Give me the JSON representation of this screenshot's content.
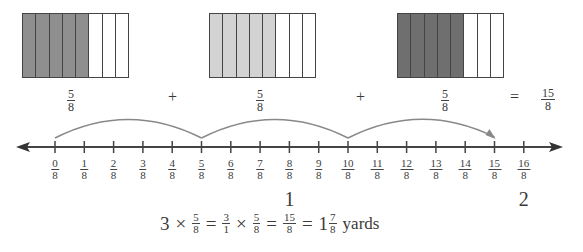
{
  "bars": [
    {
      "label_num": "5",
      "label_den": "8",
      "shaded": 5,
      "total": 8,
      "color": "#8f8f8f"
    },
    {
      "label_num": "5",
      "label_den": "8",
      "shaded": 5,
      "total": 8,
      "color": "#d3d3d3"
    },
    {
      "label_num": "5",
      "label_den": "8",
      "shaded": 5,
      "total": 8,
      "color": "#6f6f6f"
    }
  ],
  "operators": {
    "plus1": "+",
    "plus2": "+",
    "equals": "="
  },
  "sum": {
    "num": "15",
    "den": "8"
  },
  "number_line": {
    "ticks": [
      {
        "num": "0",
        "den": "8"
      },
      {
        "num": "1",
        "den": "8"
      },
      {
        "num": "2",
        "den": "8"
      },
      {
        "num": "3",
        "den": "8"
      },
      {
        "num": "4",
        "den": "8"
      },
      {
        "num": "5",
        "den": "8"
      },
      {
        "num": "6",
        "den": "8"
      },
      {
        "num": "7",
        "den": "8"
      },
      {
        "num": "8",
        "den": "8"
      },
      {
        "num": "9",
        "den": "8"
      },
      {
        "num": "10",
        "den": "8"
      },
      {
        "num": "11",
        "den": "8"
      },
      {
        "num": "12",
        "den": "8"
      },
      {
        "num": "13",
        "den": "8"
      },
      {
        "num": "14",
        "den": "8"
      },
      {
        "num": "15",
        "den": "8"
      },
      {
        "num": "16",
        "den": "8"
      }
    ],
    "wholes": [
      {
        "value": "1",
        "tick": 8
      },
      {
        "value": "2",
        "tick": 16
      }
    ],
    "jumps": [
      [
        0,
        5
      ],
      [
        5,
        10
      ],
      [
        10,
        15
      ]
    ]
  },
  "equation": {
    "a": "3",
    "times1": "×",
    "f1_num": "5",
    "f1_den": "8",
    "eq1": "=",
    "f2_num": "3",
    "f2_den": "1",
    "times2": "×",
    "f3_num": "5",
    "f3_den": "8",
    "eq2": "=",
    "f4_num": "15",
    "f4_den": "8",
    "eq3": "=",
    "whole": "1",
    "f5_num": "7",
    "f5_den": "8",
    "unit": "yards"
  }
}
